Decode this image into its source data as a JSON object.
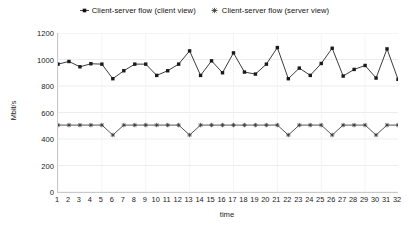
{
  "chart_data": {
    "type": "line",
    "title": "",
    "xlabel": "time",
    "ylabel": "Mbit/s",
    "grid": true,
    "legend_position": "top-center",
    "xlim": [
      1,
      32
    ],
    "ylim": [
      0,
      1200
    ],
    "ytick_labels": [
      "1200",
      "1000",
      "800",
      "600",
      "400",
      "200",
      "0"
    ],
    "ytick_values": [
      1200,
      1000,
      800,
      600,
      400,
      200,
      0
    ],
    "x": [
      1,
      2,
      3,
      4,
      5,
      6,
      7,
      8,
      9,
      10,
      11,
      12,
      13,
      14,
      15,
      16,
      17,
      18,
      19,
      20,
      21,
      22,
      23,
      24,
      25,
      26,
      27,
      28,
      29,
      30,
      31,
      32
    ],
    "xtick_labels": [
      "1",
      "2",
      "3",
      "4",
      "5",
      "6",
      "7",
      "8",
      "9",
      "10",
      "11",
      "12",
      "13",
      "14",
      "15",
      "16",
      "17",
      "18",
      "19",
      "20",
      "21",
      "22",
      "23",
      "24",
      "25",
      "26",
      "27",
      "28",
      "29",
      "30",
      "31",
      "32"
    ],
    "series": [
      {
        "name": "Client-server flow (client view)",
        "marker": "square",
        "color": "#1a1a1a",
        "values": [
          965,
          985,
          945,
          968,
          965,
          855,
          915,
          965,
          965,
          880,
          915,
          965,
          1065,
          880,
          990,
          900,
          1050,
          905,
          890,
          965,
          1090,
          855,
          935,
          880,
          970,
          1085,
          875,
          925,
          955,
          860,
          1080,
          850
        ]
      },
      {
        "name": "Client-server flow (server view)",
        "marker": "asterisk",
        "color": "#3a3a3a",
        "values": [
          505,
          505,
          505,
          505,
          505,
          430,
          505,
          505,
          505,
          505,
          505,
          505,
          430,
          505,
          505,
          505,
          505,
          505,
          505,
          505,
          505,
          430,
          505,
          505,
          505,
          430,
          505,
          505,
          505,
          430,
          505,
          505
        ]
      }
    ]
  },
  "legend": {
    "entries": [
      {
        "label": "Client-server flow (client view)",
        "icon": "filled-square-marker-icon"
      },
      {
        "label": "Client-server flow (server view)",
        "icon": "asterisk-marker-icon"
      }
    ]
  },
  "axes": {
    "y_title": "Mbit/s",
    "x_title": "time"
  }
}
